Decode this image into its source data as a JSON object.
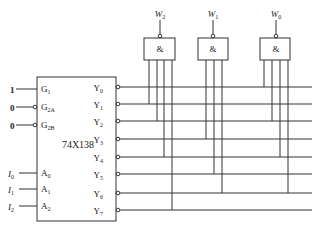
{
  "decoder": {
    "name": "74X138",
    "inputs": [
      {
        "pin": "G",
        "sub": "1",
        "value": "1",
        "active_low": false
      },
      {
        "pin": "G",
        "sub": "2A",
        "value": "0",
        "active_low": true
      },
      {
        "pin": "G",
        "sub": "2B",
        "value": "0",
        "active_low": true
      },
      {
        "pin": "A",
        "sub": "0",
        "signal": "I",
        "signal_sub": "0"
      },
      {
        "pin": "A",
        "sub": "1",
        "signal": "I",
        "signal_sub": "1"
      },
      {
        "pin": "A",
        "sub": "2",
        "signal": "I",
        "signal_sub": "2"
      }
    ],
    "outputs": [
      {
        "pin": "Y",
        "sub": "0"
      },
      {
        "pin": "Y",
        "sub": "1"
      },
      {
        "pin": "Y",
        "sub": "2"
      },
      {
        "pin": "Y",
        "sub": "3"
      },
      {
        "pin": "Y",
        "sub": "4"
      },
      {
        "pin": "Y",
        "sub": "5"
      },
      {
        "pin": "Y",
        "sub": "6"
      },
      {
        "pin": "Y",
        "sub": "7"
      }
    ]
  },
  "gates": [
    {
      "symbol": "&",
      "output": "W",
      "output_sub": "2",
      "inputs_from": [
        "Y1",
        "Y2",
        "Y4",
        "Y7"
      ]
    },
    {
      "symbol": "&",
      "output": "W",
      "output_sub": "1",
      "inputs_from": [
        "Y3",
        "Y5",
        "Y6"
      ]
    },
    {
      "symbol": "&",
      "output": "W",
      "output_sub": "0",
      "inputs_from": [
        "Y0",
        "Y2",
        "Y4",
        "Y6"
      ]
    }
  ]
}
